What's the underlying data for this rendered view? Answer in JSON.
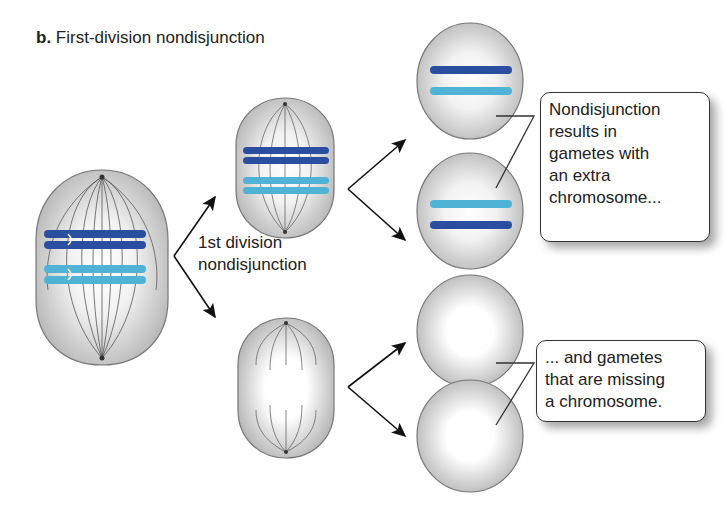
{
  "figure": {
    "panel_letter": "b.",
    "title": "First-division nondisjunction"
  },
  "process_label": {
    "line1": "1st division",
    "line2": "nondisjunction"
  },
  "callouts": [
    {
      "lines": [
        "Nondisjunction",
        "results in",
        "gametes with",
        "an extra",
        "chromosome..."
      ]
    },
    {
      "lines": [
        "... and gametes",
        "that are missing",
        "a chromosome."
      ]
    }
  ],
  "colors": {
    "chromosome_dark": "#2b4ea0",
    "chromosome_light": "#4fb3d6",
    "cell_fill": "#c8c8c8",
    "cell_highlight": "#ffffff",
    "arrow": "#111111"
  },
  "cells": {
    "parent": "meiosis I metaphase cell with two homologous pairs",
    "daughter_top": "cell with both homologs",
    "daughter_bottom": "cell with no homologs",
    "gametes_extra": 2,
    "gametes_missing": 2
  }
}
